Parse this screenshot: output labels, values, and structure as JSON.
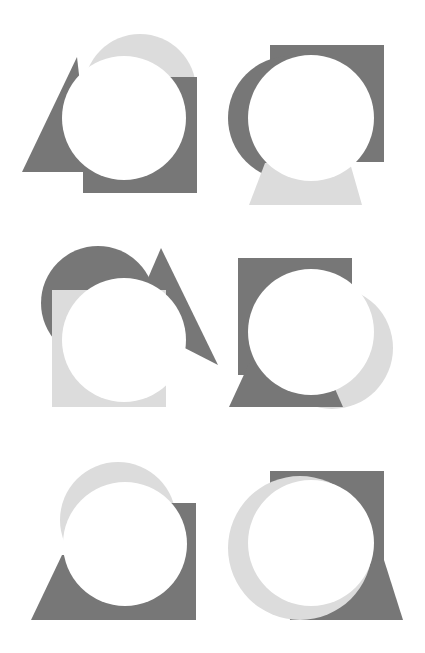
{
  "canvas": {
    "width": 425,
    "height": 653,
    "background": "#ffffff"
  },
  "colors": {
    "dark": "#777777",
    "light": "#dcdcdc",
    "hole": "#ffffff"
  },
  "figures": [
    {
      "id": "figure-1",
      "shapes": [
        {
          "type": "circle",
          "tone": "light",
          "cx": 140,
          "cy": 90,
          "r": 56
        },
        {
          "type": "polygon",
          "tone": "dark",
          "points": "77,57 22,172 90,172"
        },
        {
          "type": "rect",
          "tone": "dark",
          "x": 83,
          "y": 77,
          "w": 114,
          "h": 116
        },
        {
          "type": "circle",
          "tone": "hole",
          "cx": 124,
          "cy": 118,
          "r": 62
        }
      ]
    },
    {
      "id": "figure-2",
      "shapes": [
        {
          "type": "rect",
          "tone": "dark",
          "x": 270,
          "y": 45,
          "w": 114,
          "h": 117
        },
        {
          "type": "circle",
          "tone": "dark",
          "cx": 290,
          "cy": 118,
          "r": 62
        },
        {
          "type": "polygon",
          "tone": "light",
          "points": "265,163 350,163 362,205 249,205"
        },
        {
          "type": "circle",
          "tone": "hole",
          "cx": 311,
          "cy": 118,
          "r": 63
        }
      ]
    },
    {
      "id": "figure-3",
      "shapes": [
        {
          "type": "circle",
          "tone": "dark",
          "cx": 98,
          "cy": 303,
          "r": 57
        },
        {
          "type": "polygon",
          "tone": "dark",
          "points": "161,248 130,320 218,365"
        },
        {
          "type": "rect",
          "tone": "light",
          "x": 52,
          "y": 290,
          "w": 114,
          "h": 117
        },
        {
          "type": "circle",
          "tone": "hole",
          "cx": 124,
          "cy": 340,
          "r": 62
        }
      ]
    },
    {
      "id": "figure-4",
      "shapes": [
        {
          "type": "circle",
          "tone": "light",
          "cx": 332,
          "cy": 348,
          "r": 61
        },
        {
          "type": "rect",
          "tone": "dark",
          "x": 238,
          "y": 258,
          "w": 114,
          "h": 117
        },
        {
          "type": "polygon",
          "tone": "dark",
          "points": "253,355 229,407 343,407 320,355"
        },
        {
          "type": "circle",
          "tone": "hole",
          "cx": 311,
          "cy": 332,
          "r": 63
        }
      ]
    },
    {
      "id": "figure-5",
      "shapes": [
        {
          "type": "circle",
          "tone": "light",
          "cx": 118,
          "cy": 520,
          "r": 58
        },
        {
          "type": "rect",
          "tone": "dark",
          "x": 118,
          "y": 503,
          "w": 78,
          "h": 117
        },
        {
          "type": "polygon",
          "tone": "dark",
          "points": "62,555 31,620 130,620 130,555"
        },
        {
          "type": "circle",
          "tone": "hole",
          "cx": 125,
          "cy": 544,
          "r": 62
        }
      ]
    },
    {
      "id": "figure-6",
      "shapes": [
        {
          "type": "rect",
          "tone": "dark",
          "x": 270,
          "y": 471,
          "w": 114,
          "h": 100
        },
        {
          "type": "polygon",
          "tone": "dark",
          "points": "285,571 384,560 403,620 290,620"
        },
        {
          "type": "circle",
          "tone": "light",
          "cx": 300,
          "cy": 548,
          "r": 72
        },
        {
          "type": "circle",
          "tone": "hole",
          "cx": 311,
          "cy": 543,
          "r": 63
        }
      ]
    }
  ]
}
